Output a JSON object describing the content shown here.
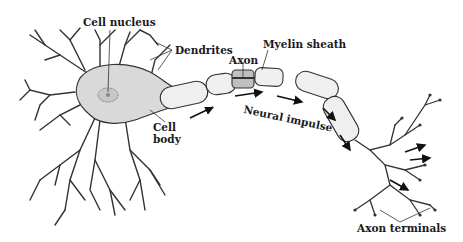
{
  "diagram": {
    "colors": {
      "stroke": "#2a2a2a",
      "cell_fill": "#d9d9d9",
      "sheath_fill": "#efefef",
      "text": "#1a1a1a",
      "background": "#ffffff"
    },
    "labels": {
      "cell_nucleus": "Cell nucleus",
      "dendrites": "Dendrites",
      "axon": "Axon",
      "myelin_sheath": "Myelin sheath",
      "cell_body_line1": "Cell",
      "cell_body_line2": "body",
      "neural_impulse": "Neural impulse",
      "axon_terminals": "Axon terminals"
    }
  }
}
